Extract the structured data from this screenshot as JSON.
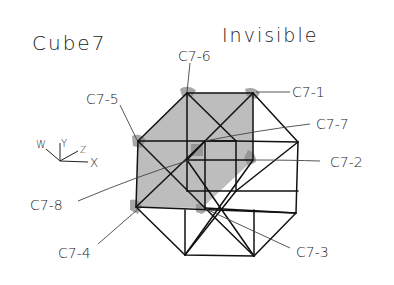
{
  "title": "Cube7",
  "subtitle": "Invisible",
  "axes": {
    "labels": [
      "W",
      "Y",
      "Z",
      "X"
    ]
  },
  "vertex_labels": [
    {
      "id": "c7-6",
      "text": "C7-6"
    },
    {
      "id": "c7-1",
      "text": "C7-1"
    },
    {
      "id": "c7-5",
      "text": "C7-5"
    },
    {
      "id": "c7-7",
      "text": "C7-7"
    },
    {
      "id": "c7-2",
      "text": "C7-2"
    },
    {
      "id": "c7-8",
      "text": "C7-8"
    },
    {
      "id": "c7-4",
      "text": "C7-4"
    },
    {
      "id": "c7-3",
      "text": "C7-3"
    }
  ],
  "colors": {
    "ink": "#111111",
    "shading": "#bdbdbd",
    "background": "#ffffff"
  }
}
